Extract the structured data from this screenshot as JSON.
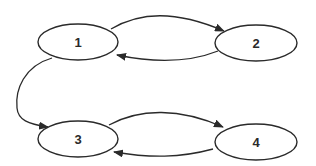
{
  "diagram": {
    "type": "directed-graph",
    "nodes": [
      {
        "id": "1",
        "label": "1"
      },
      {
        "id": "2",
        "label": "2"
      },
      {
        "id": "3",
        "label": "3"
      },
      {
        "id": "4",
        "label": "4"
      }
    ],
    "edges": [
      {
        "from": "1",
        "to": "2"
      },
      {
        "from": "2",
        "to": "1"
      },
      {
        "from": "1",
        "to": "3"
      },
      {
        "from": "3",
        "to": "4"
      },
      {
        "from": "4",
        "to": "3"
      }
    ],
    "colors": {
      "stroke": "#2a2a2a",
      "background": "#ffffff"
    }
  }
}
